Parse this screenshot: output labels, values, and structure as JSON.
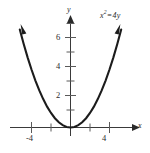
{
  "figure": {
    "name": "parabola-graph",
    "background_color": "#ffffff",
    "curve_color": "#1c1c1c",
    "axis_color": "#3a3a3a"
  },
  "labels": {
    "equation": "x",
    "equation_exponent": "2",
    "equation_operator": "=",
    "equation_rhs": "4y",
    "equation_full": "x² = 4y",
    "x_axis_name": "x",
    "y_axis_name": "y"
  },
  "chart_data": {
    "type": "line",
    "title": "",
    "subtitle": "",
    "equation": "x² = 4y",
    "function": "y = x^2 / 4",
    "xlabel": "x",
    "ylabel": "y",
    "grid": false,
    "legend": null,
    "xlim": [
      -5.2,
      5.2
    ],
    "ylim": [
      -0.7,
      7.4
    ],
    "x_ticks": [
      -4,
      4
    ],
    "x_tick_labels": [
      "-4",
      "4"
    ],
    "x_minor_ticks": [
      -2,
      2
    ],
    "y_ticks": [
      2,
      4,
      6
    ],
    "y_tick_labels": [
      "2",
      "4",
      "6"
    ],
    "y_minor_ticks": [
      1,
      3,
      5,
      7
    ],
    "annotations": [
      {
        "text": "x² = 4y",
        "x": 4.6,
        "y": 7.2
      }
    ],
    "series": [
      {
        "name": "x² = 4y",
        "color": "#1c1c1c",
        "arrow_ends": [
          "start",
          "end"
        ],
        "x": [
          -5.2,
          -4.8,
          -4.4,
          -4.0,
          -3.6,
          -3.2,
          -2.8,
          -2.4,
          -2.0,
          -1.6,
          -1.2,
          -0.8,
          -0.4,
          0.0,
          0.4,
          0.8,
          1.2,
          1.6,
          2.0,
          2.4,
          2.8,
          3.2,
          3.6,
          4.0,
          4.4,
          4.8,
          5.2
        ],
        "values": [
          6.76,
          5.76,
          4.84,
          4.0,
          3.24,
          2.56,
          1.96,
          1.44,
          1.0,
          0.64,
          0.36,
          0.16,
          0.04,
          0.0,
          0.04,
          0.16,
          0.36,
          0.64,
          1.0,
          1.44,
          1.96,
          2.56,
          3.24,
          4.0,
          4.84,
          5.76,
          6.76
        ]
      }
    ]
  }
}
